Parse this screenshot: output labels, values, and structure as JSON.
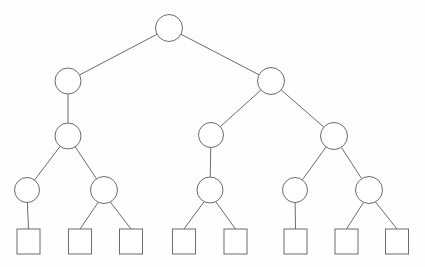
{
  "diagram": {
    "type": "tree",
    "canvas": {
      "width": 425,
      "height": 267
    },
    "style": {
      "background_color": "#fefefe",
      "stroke_color": "#6b6b6b",
      "node_fill_color": "#ffffff",
      "stroke_width": 1
    },
    "node_shapes": {
      "internal": "circle",
      "leaf": "square"
    },
    "levels": [
      {
        "index": 0,
        "name": "root",
        "y": 28
      },
      {
        "index": 1,
        "name": "level-1",
        "y": 81
      },
      {
        "index": 2,
        "name": "level-2",
        "y": 136
      },
      {
        "index": 3,
        "name": "level-3",
        "y": 190
      },
      {
        "index": 4,
        "name": "leaves",
        "y": 241
      }
    ],
    "nodes": [
      {
        "id": "n0",
        "label": "",
        "shape": "circle",
        "cx": 169,
        "cy": 28,
        "r": 13.5,
        "level": 0
      },
      {
        "id": "n1",
        "label": "",
        "shape": "circle",
        "cx": 68,
        "cy": 81,
        "r": 13.0,
        "level": 1
      },
      {
        "id": "n2",
        "label": "",
        "shape": "circle",
        "cx": 271,
        "cy": 81,
        "r": 13.5,
        "level": 1
      },
      {
        "id": "n3",
        "label": "",
        "shape": "circle",
        "cx": 68,
        "cy": 136,
        "r": 13.0,
        "level": 2
      },
      {
        "id": "n4",
        "label": "",
        "shape": "circle",
        "cx": 211,
        "cy": 135,
        "r": 12.5,
        "level": 2
      },
      {
        "id": "n5",
        "label": "",
        "shape": "circle",
        "cx": 334,
        "cy": 136,
        "r": 13.5,
        "level": 2
      },
      {
        "id": "n6",
        "label": "",
        "shape": "circle",
        "cx": 27,
        "cy": 190,
        "r": 12.5,
        "level": 3
      },
      {
        "id": "n7",
        "label": "",
        "shape": "circle",
        "cx": 104,
        "cy": 190,
        "r": 13.5,
        "level": 3
      },
      {
        "id": "n8",
        "label": "",
        "shape": "circle",
        "cx": 210,
        "cy": 190,
        "r": 13.0,
        "level": 3
      },
      {
        "id": "n9",
        "label": "",
        "shape": "circle",
        "cx": 295,
        "cy": 190,
        "r": 12.5,
        "level": 3
      },
      {
        "id": "n10",
        "label": "",
        "shape": "circle",
        "cx": 369,
        "cy": 190,
        "r": 13.5,
        "level": 3
      },
      {
        "id": "s1",
        "label": "",
        "shape": "square",
        "cx": 28.5,
        "cy": 241.5,
        "w": 23,
        "h": 25,
        "level": 4
      },
      {
        "id": "s2",
        "label": "",
        "shape": "square",
        "cx": 80.0,
        "cy": 241.5,
        "w": 23,
        "h": 25,
        "level": 4
      },
      {
        "id": "s3",
        "label": "",
        "shape": "square",
        "cx": 131.0,
        "cy": 241.5,
        "w": 23,
        "h": 25,
        "level": 4
      },
      {
        "id": "s4",
        "label": "",
        "shape": "square",
        "cx": 184.0,
        "cy": 241.5,
        "w": 23,
        "h": 25,
        "level": 4
      },
      {
        "id": "s5",
        "label": "",
        "shape": "square",
        "cx": 235.5,
        "cy": 241.5,
        "w": 23,
        "h": 25,
        "level": 4
      },
      {
        "id": "s6",
        "label": "",
        "shape": "square",
        "cx": 295.5,
        "cy": 241.5,
        "w": 23,
        "h": 25,
        "level": 4
      },
      {
        "id": "s7",
        "label": "",
        "shape": "square",
        "cx": 346.5,
        "cy": 241.5,
        "w": 23,
        "h": 25,
        "level": 4
      },
      {
        "id": "s8",
        "label": "",
        "shape": "square",
        "cx": 397.0,
        "cy": 241.5,
        "w": 23,
        "h": 25,
        "level": 4
      }
    ],
    "edges": [
      {
        "from": "n0",
        "to": "n1"
      },
      {
        "from": "n0",
        "to": "n2"
      },
      {
        "from": "n1",
        "to": "n3"
      },
      {
        "from": "n2",
        "to": "n4"
      },
      {
        "from": "n2",
        "to": "n5"
      },
      {
        "from": "n3",
        "to": "n6"
      },
      {
        "from": "n3",
        "to": "n7"
      },
      {
        "from": "n4",
        "to": "n8"
      },
      {
        "from": "n5",
        "to": "n9"
      },
      {
        "from": "n5",
        "to": "n10"
      },
      {
        "from": "n6",
        "to": "s1"
      },
      {
        "from": "n7",
        "to": "s2"
      },
      {
        "from": "n7",
        "to": "s3"
      },
      {
        "from": "n8",
        "to": "s4"
      },
      {
        "from": "n8",
        "to": "s5"
      },
      {
        "from": "n9",
        "to": "s6"
      },
      {
        "from": "n10",
        "to": "s7"
      },
      {
        "from": "n10",
        "to": "s8"
      }
    ]
  }
}
